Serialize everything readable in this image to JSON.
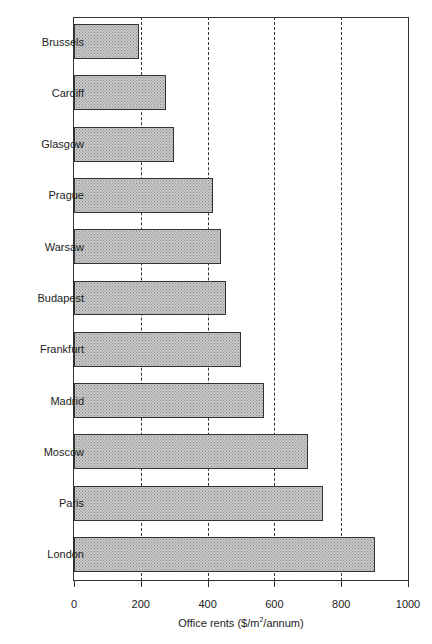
{
  "chart_data": {
    "type": "bar",
    "orientation": "horizontal",
    "title": "",
    "xlabel": "Office rents ($/m²/annum)",
    "xlabel_parts": {
      "pre": "Office rents ($/m",
      "sup": "2",
      "post": "/annum)"
    },
    "ylabel": "",
    "categories": [
      "Brussels",
      "Cardiff",
      "Glasgow",
      "Prague",
      "Warsaw",
      "Budapest",
      "Frankfurt",
      "Madrid",
      "Moscow",
      "Paris",
      "London"
    ],
    "values": [
      195,
      275,
      300,
      415,
      440,
      455,
      500,
      570,
      700,
      745,
      900
    ],
    "xlim": [
      0,
      1000
    ],
    "xticks": [
      0,
      200,
      400,
      600,
      800,
      1000
    ],
    "xtick_labels": [
      "0",
      "200",
      "400",
      "600",
      "800",
      "1000"
    ],
    "grid": {
      "vertical_dashed_at": [
        200,
        400,
        600,
        800
      ]
    },
    "legend": null,
    "bar_fill": "crosshatch grey",
    "colors": {
      "bar_fill": "#c9c9c9",
      "bar_border": "#333333",
      "axis": "#333333"
    }
  }
}
